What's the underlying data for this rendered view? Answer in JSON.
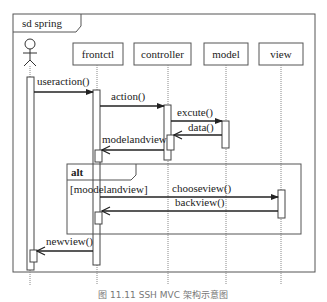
{
  "frame": {
    "label": "sd spring"
  },
  "actor": {
    "name": "user"
  },
  "lifelines": [
    {
      "id": "frontctl",
      "label": "frontctl"
    },
    {
      "id": "controller",
      "label": "controller"
    },
    {
      "id": "model",
      "label": "model"
    },
    {
      "id": "view",
      "label": "view"
    }
  ],
  "messages": [
    {
      "label": "useraction()",
      "from": "actor",
      "to": "frontctl",
      "type": "sync"
    },
    {
      "label": "action()",
      "from": "frontctl",
      "to": "controller",
      "type": "sync"
    },
    {
      "label": "excute()",
      "from": "controller",
      "to": "model",
      "type": "sync"
    },
    {
      "label": "data()",
      "from": "model",
      "to": "controller",
      "type": "return"
    },
    {
      "label": "modelandview",
      "from": "controller",
      "to": "frontctl",
      "type": "return"
    },
    {
      "label": "chooseview()",
      "from": "frontctl",
      "to": "view",
      "type": "sync"
    },
    {
      "label": "backview()",
      "from": "view",
      "to": "frontctl",
      "type": "return"
    },
    {
      "label": "newview()",
      "from": "frontctl",
      "to": "actor",
      "type": "return"
    }
  ],
  "fragment": {
    "operator": "alt",
    "guard": "[moodelandview]"
  },
  "caption": "图 11.11  SSH MVC 架构示意图"
}
